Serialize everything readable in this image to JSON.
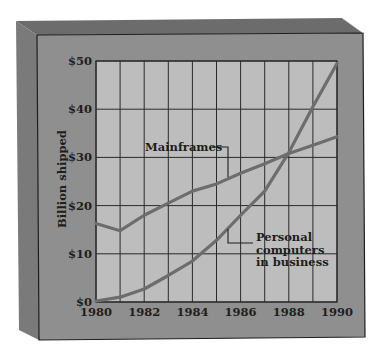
{
  "chart_data": {
    "type": "line",
    "title": "",
    "xlabel": "",
    "ylabel": "Billion shipped",
    "x": [
      1980,
      1981,
      1982,
      1983,
      1984,
      1985,
      1986,
      1987,
      1988,
      1989,
      1990
    ],
    "x_tick_labels": [
      "1980",
      "1982",
      "1984",
      "1986",
      "1988",
      "1990"
    ],
    "y_tick_labels": [
      "$0",
      "$10",
      "$20",
      "$30",
      "$40",
      "$50"
    ],
    "ylim": [
      0,
      50
    ],
    "xlim": [
      1980,
      1990
    ],
    "grid": true,
    "legend": "inline annotations",
    "series": [
      {
        "name": "Mainframes",
        "label_lines": [
          "Mainframes"
        ],
        "values": [
          16.3,
          14.8,
          18,
          20.5,
          23,
          24.5,
          26.7,
          28.7,
          30.8,
          32.5,
          34.3
        ]
      },
      {
        "name": "Personal computers in business",
        "label_lines": [
          "Personal",
          "computers",
          "in business"
        ],
        "values": [
          0.2,
          1,
          2.7,
          5.5,
          8.5,
          12.8,
          18,
          23,
          31,
          40.5,
          49.5
        ]
      }
    ]
  },
  "colors": {
    "page_background": "#ffffff",
    "box_front": "#8f8f8f",
    "box_top": "#6c6c6c",
    "box_left": "#7a7a7a",
    "plot_background": "#bdbdbd",
    "grid": "#2a2a2a",
    "line": "#6d6d6d",
    "text": "#1e1e1e"
  }
}
